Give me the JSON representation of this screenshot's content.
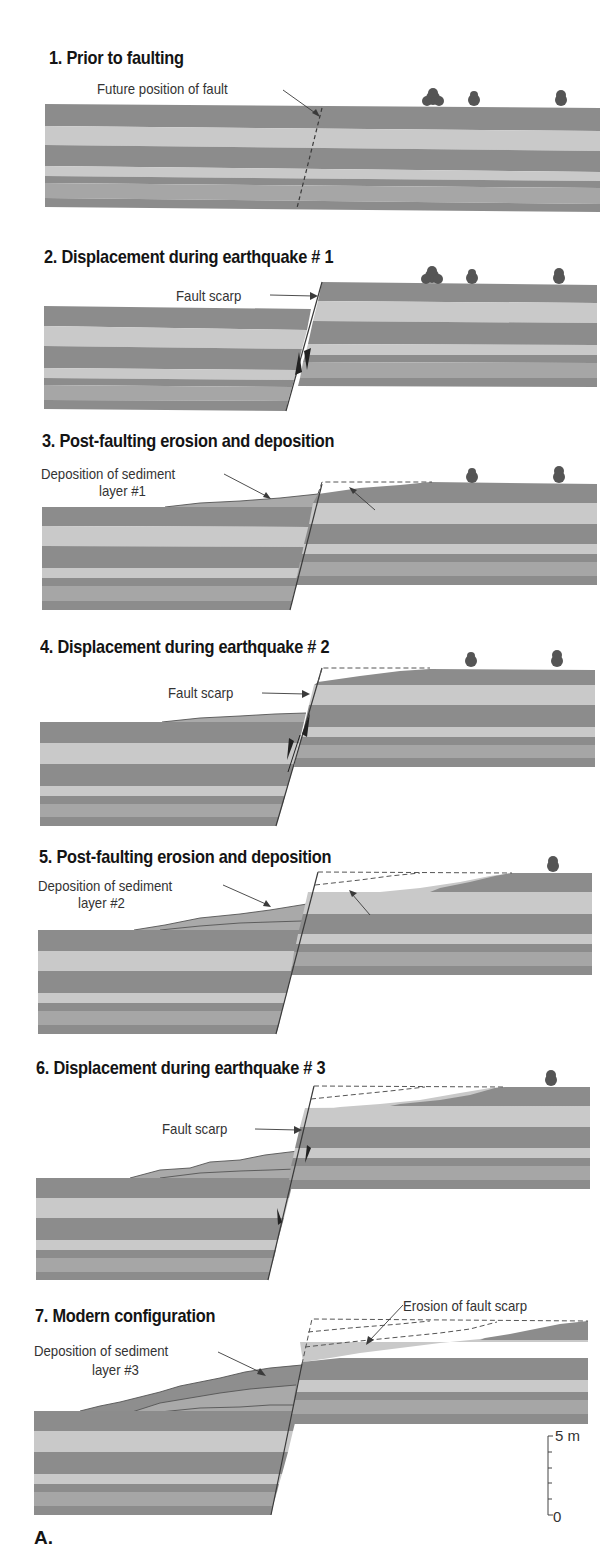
{
  "colors": {
    "dark_layer": "#8c8c8c",
    "light_layer": "#c9c9c9",
    "medium_layer": "#a6a6a6",
    "sediment": "#a9a9a9",
    "sediment_dark": "#8e8e8e",
    "tree": "#555555",
    "line": "#3a3a3a",
    "dash": "#555555",
    "text": "#333333",
    "title": "#141414"
  },
  "panels": [
    {
      "id": 1,
      "title": "1. Prior to faulting",
      "title_pos": [
        49,
        47
      ],
      "labels": [
        {
          "text": "Future position of fault",
          "pos": [
            97,
            80
          ],
          "arrow": [
            [
              283,
              90
            ],
            [
              320,
              116
            ]
          ]
        }
      ]
    },
    {
      "id": 2,
      "title": "2. Displacement during earthquake # 1",
      "title_pos": [
        44,
        246
      ],
      "labels": [
        {
          "text": "Fault scarp",
          "pos": [
            176,
            287
          ],
          "arrow": [
            [
              270,
              295
            ],
            [
              318,
              296
            ]
          ]
        }
      ]
    },
    {
      "id": 3,
      "title": "3. Post-faulting erosion and deposition",
      "title_pos": [
        42,
        430
      ],
      "labels": [
        {
          "text": "Deposition of sediment",
          "pos": [
            41,
            465
          ],
          "arrow": [
            [
              224,
              474
            ],
            [
              270,
              499
            ]
          ]
        },
        {
          "text": "layer #1",
          "pos": [
            99,
            482
          ]
        },
        {
          "text": "Erosion of fault scarp",
          "pos": [
            383,
            505
          ],
          "arrow": [
            [
              375,
              510
            ],
            [
              350,
              488
            ]
          ]
        }
      ]
    },
    {
      "id": 4,
      "title": "4. Displacement during earthquake # 2",
      "title_pos": [
        40,
        636
      ],
      "labels": [
        {
          "text": "Fault scarp",
          "pos": [
            168,
            684
          ],
          "arrow": [
            [
              262,
              693
            ],
            [
              310,
              694
            ]
          ]
        }
      ]
    },
    {
      "id": 5,
      "title": "5. Post-faulting erosion and deposition",
      "title_pos": [
        39,
        846
      ],
      "labels": [
        {
          "text": "Deposition of sediment",
          "pos": [
            38,
            877
          ],
          "arrow": [
            [
              223,
              885
            ],
            [
              270,
              907
            ]
          ]
        },
        {
          "text": "layer #2",
          "pos": [
            78,
            894
          ]
        },
        {
          "text": "Erosion of fault scarp",
          "pos": [
            378,
            911
          ],
          "arrow": [
            [
              370,
              915
            ],
            [
              350,
              891
            ]
          ]
        }
      ]
    },
    {
      "id": 6,
      "title": "6. Displacement during earthquake # 3",
      "title_pos": [
        36,
        1057
      ],
      "labels": [
        {
          "text": "Fault scarp",
          "pos": [
            162,
            1120
          ],
          "arrow": [
            [
              255,
              1129
            ],
            [
              302,
              1130
            ]
          ]
        }
      ]
    },
    {
      "id": 7,
      "title": "7. Modern configuration",
      "title_pos": [
        35,
        1305
      ],
      "labels": [
        {
          "text": "Erosion of fault scarp",
          "pos": [
            403,
            1297
          ],
          "arrow": [
            [
              403,
              1305
            ],
            [
              368,
              1344
            ]
          ]
        },
        {
          "text": "Deposition of sediment",
          "pos": [
            34,
            1342
          ],
          "arrow": [
            [
              218,
              1352
            ],
            [
              265,
              1375
            ]
          ]
        },
        {
          "text": "layer #3",
          "pos": [
            92,
            1361
          ]
        }
      ]
    }
  ],
  "scale_bar": {
    "top_label": "5 m",
    "bottom_label": "0",
    "unit": "m",
    "max": 5,
    "min": 0,
    "ticks": 5
  },
  "figure_letter": "A."
}
